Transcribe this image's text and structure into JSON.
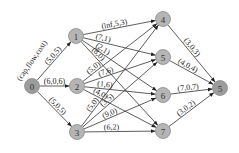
{
  "diagram": {
    "type": "flow-network",
    "legend_label": "(cap,flow,cost)",
    "colors": {
      "node_fill": "#b5b5b5",
      "terminal_fill": "#9c9c9c",
      "edge": "#333333"
    },
    "nodes": [
      {
        "id": "n0",
        "label": "0",
        "x": 32,
        "y": 86,
        "terminal": true
      },
      {
        "id": "n1",
        "label": "1",
        "x": 76,
        "y": 36
      },
      {
        "id": "n2",
        "label": "2",
        "x": 77,
        "y": 86
      },
      {
        "id": "n3",
        "label": "3",
        "x": 77,
        "y": 132
      },
      {
        "id": "n4",
        "label": "4",
        "x": 163,
        "y": 19
      },
      {
        "id": "n5",
        "label": "5",
        "x": 163,
        "y": 57
      },
      {
        "id": "n6",
        "label": "6",
        "x": 163,
        "y": 95
      },
      {
        "id": "n7",
        "label": "7",
        "x": 163,
        "y": 131
      },
      {
        "id": "sink",
        "label": "5",
        "x": 220,
        "y": 88,
        "terminal": true
      }
    ],
    "edges": [
      {
        "from": "n0",
        "to": "n1",
        "label": "(5,0,5)"
      },
      {
        "from": "n0",
        "to": "n2",
        "label": "(6,0,6)"
      },
      {
        "from": "n0",
        "to": "n3",
        "label": "(5,0,5)"
      },
      {
        "from": "n1",
        "to": "n4",
        "label": "(inf,5,3)"
      },
      {
        "from": "n1",
        "to": "n5",
        "label": "(7,1)"
      },
      {
        "from": "n1",
        "to": "n6",
        "label": "(2,1)"
      },
      {
        "from": "n1",
        "to": "n7",
        "label": "(8,0)"
      },
      {
        "from": "n2",
        "to": "n4",
        "label": "(5,0)"
      },
      {
        "from": "n2",
        "to": "n5",
        "label": "(7,6)"
      },
      {
        "from": "n2",
        "to": "n6",
        "label": "(1,6)"
      },
      {
        "from": "n2",
        "to": "n7",
        "label": "(4,0)"
      },
      {
        "from": "n3",
        "to": "n4",
        "label": "(5,0)"
      },
      {
        "from": "n3",
        "to": "n5",
        "label": "(3,5)"
      },
      {
        "from": "n3",
        "to": "n6",
        "label": "(9,0)"
      },
      {
        "from": "n3",
        "to": "n7",
        "label": "(6,2)"
      },
      {
        "from": "n4",
        "to": "sink",
        "label": "(3,0,3)"
      },
      {
        "from": "n5",
        "to": "sink",
        "label": "(4,0,4)"
      },
      {
        "from": "n6",
        "to": "sink",
        "label": "(7,0,7)"
      },
      {
        "from": "n7",
        "to": "sink",
        "label": "(3,0,2)"
      }
    ]
  }
}
